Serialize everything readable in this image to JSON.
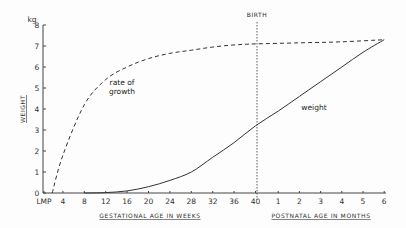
{
  "chart_data": {
    "type": "line",
    "title": "",
    "ylabel": "WEIGHT",
    "yunit": "kg",
    "ylim": [
      0,
      8
    ],
    "yticks": [
      "0",
      "1",
      "2",
      "3",
      "4",
      "5",
      "6",
      "7",
      "8"
    ],
    "xlabel_left": "GESTATIONAL AGE IN WEEKS",
    "xlabel_right": "POSTNATAL AGE IN MONTHS",
    "xticks_gestational": [
      "LMP",
      "4",
      "8",
      "12",
      "16",
      "20",
      "24",
      "28",
      "32",
      "36",
      "40"
    ],
    "xticks_postnatal": [
      "1",
      "2",
      "3",
      "4",
      "5",
      "6"
    ],
    "annotations": [
      {
        "text": "BIRTH",
        "x": "40 weeks",
        "style": "vertical dotted line"
      }
    ],
    "grid": false,
    "series": [
      {
        "name": "rate of growth",
        "style": "dashed",
        "x": [
          "LMP",
          "2w",
          "4w",
          "8w",
          "12w",
          "16w",
          "20w",
          "24w",
          "28w",
          "32w",
          "36w",
          "40w",
          "2m",
          "4m",
          "6m"
        ],
        "values": [
          0,
          0.0,
          1.8,
          4.2,
          5.4,
          6.0,
          6.4,
          6.65,
          6.8,
          6.95,
          7.05,
          7.1,
          7.15,
          7.2,
          7.3
        ]
      },
      {
        "name": "weight",
        "style": "solid",
        "x": [
          "LMP",
          "8w",
          "12w",
          "16w",
          "20w",
          "24w",
          "28w",
          "32w",
          "36w",
          "40w",
          "1m",
          "2m",
          "3m",
          "4m",
          "5m",
          "6m"
        ],
        "values": [
          0,
          0.0,
          0.02,
          0.1,
          0.3,
          0.6,
          1.0,
          1.7,
          2.4,
          3.2,
          3.9,
          4.6,
          5.3,
          6.0,
          6.7,
          7.3
        ]
      }
    ]
  },
  "labels": {
    "unit": "kg",
    "yaxis_title": "WEIGHT",
    "birth": "BIRTH",
    "rate_line1": "rate of",
    "rate_line2": "growth",
    "weight": "weight",
    "xaxis_left": "GESTATIONAL AGE IN WEEKS",
    "xaxis_right": "POSTNATAL AGE IN MONTHS"
  }
}
